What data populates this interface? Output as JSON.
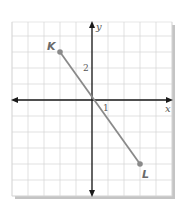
{
  "chart_data": {
    "type": "line",
    "title": "",
    "xlabel": "x",
    "ylabel": "y",
    "xlim": [
      -5,
      5
    ],
    "ylim": [
      -6,
      5
    ],
    "grid": true,
    "grid_step": 1,
    "tick_labels": [
      {
        "axis": "x",
        "value": 1,
        "text": "1"
      },
      {
        "axis": "y",
        "value": 2,
        "text": "2"
      }
    ],
    "series": [
      {
        "name": "segment KL",
        "points": [
          {
            "label": "K",
            "x": -2,
            "y": 3
          },
          {
            "label": "L",
            "x": 3,
            "y": -4
          }
        ]
      }
    ],
    "colors": {
      "segment": "#8a8a8a",
      "point": "#8a8a8a",
      "axis": "#1a1a1a",
      "grid": "#d4d4d4",
      "shadow": "#b8b8b8",
      "label": "#6a6a6a"
    }
  },
  "labels": {
    "x_axis": "x",
    "y_axis": "y",
    "tick_x1": "1",
    "tick_y2": "2",
    "point_k": "K",
    "point_l": "L"
  }
}
